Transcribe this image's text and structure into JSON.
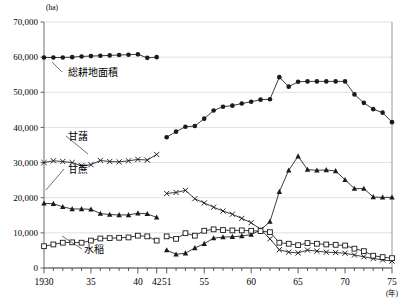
{
  "chart_data": {
    "type": "line",
    "title": "",
    "ylabel": "(ha)",
    "xlabel": "(年)",
    "ylim": [
      0,
      70000
    ],
    "ytick_labels": [
      "0",
      "10,000",
      "20,000",
      "30,000",
      "40,000",
      "50,000",
      "60,000",
      "70,000"
    ],
    "ytick_values": [
      0,
      10000,
      20000,
      30000,
      40000,
      50000,
      60000,
      70000
    ],
    "grid": true,
    "xtick_labels": [
      "1930",
      "35",
      "40",
      "42",
      "51",
      "55",
      "60",
      "65",
      "70",
      "75"
    ],
    "xtick_values": [
      1930,
      1935,
      1940,
      1942,
      1951,
      1955,
      1960,
      1965,
      1970,
      1975
    ],
    "axis_break": {
      "after": 1942,
      "before": 1951
    },
    "legend_position": "inline-annotations",
    "series": [
      {
        "name": "総耕地面積",
        "marker": "filled-circle",
        "x": [
          1930,
          1931,
          1932,
          1933,
          1934,
          1935,
          1936,
          1937,
          1938,
          1939,
          1940,
          1941,
          1942
        ],
        "values": [
          59900,
          59900,
          59900,
          60000,
          60200,
          60300,
          60400,
          60500,
          60600,
          60700,
          60800,
          59800,
          60000
        ]
      },
      {
        "name": "総耕地面積",
        "marker": "filled-circle",
        "x": [
          1951,
          1952,
          1953,
          1954,
          1955,
          1956,
          1957,
          1958,
          1959,
          1960,
          1961,
          1962,
          1963,
          1964,
          1965,
          1966,
          1967,
          1968,
          1969,
          1970,
          1971,
          1972,
          1973,
          1974,
          1975
        ],
        "values": [
          37200,
          38800,
          40200,
          40400,
          42500,
          44800,
          45900,
          46200,
          46800,
          47300,
          47900,
          48000,
          54300,
          51600,
          53000,
          53100,
          53100,
          53100,
          53100,
          53100,
          49400,
          47000,
          45200,
          44200,
          41500
        ]
      },
      {
        "name": "甘藷",
        "marker": "cross",
        "x": [
          1930,
          1931,
          1932,
          1933,
          1934,
          1935,
          1936,
          1937,
          1938,
          1939,
          1940,
          1941,
          1942
        ],
        "values": [
          30000,
          30500,
          30300,
          30000,
          29100,
          29400,
          30600,
          30300,
          30200,
          30500,
          30900,
          30700,
          32300
        ]
      },
      {
        "name": "甘藷",
        "marker": "cross",
        "x": [
          1951,
          1952,
          1953,
          1954,
          1955,
          1956,
          1957,
          1958,
          1959,
          1960,
          1961,
          1962,
          1963,
          1964,
          1965,
          1966,
          1967,
          1968,
          1969,
          1970,
          1971,
          1972,
          1973,
          1974,
          1975
        ],
        "values": [
          21200,
          21500,
          22100,
          19700,
          18500,
          17300,
          16200,
          15300,
          14100,
          12900,
          11000,
          8300,
          5200,
          4500,
          4300,
          5100,
          4800,
          4500,
          4400,
          4200,
          3700,
          3200,
          2700,
          2300,
          2000
        ]
      },
      {
        "name": "甘蔗",
        "marker": "filled-triangle",
        "x": [
          1930,
          1931,
          1932,
          1933,
          1934,
          1935,
          1936,
          1937,
          1938,
          1939,
          1940,
          1941,
          1942
        ],
        "values": [
          18400,
          18300,
          17400,
          16800,
          16800,
          16700,
          15500,
          15200,
          15100,
          15100,
          15600,
          15400,
          14400
        ]
      },
      {
        "name": "甘蔗",
        "marker": "filled-triangle",
        "x": [
          1951,
          1952,
          1953,
          1954,
          1955,
          1956,
          1957,
          1958,
          1959,
          1960,
          1961,
          1962,
          1963,
          1964,
          1965,
          1966,
          1967,
          1968,
          1969,
          1970,
          1971,
          1972,
          1973,
          1974,
          1975
        ],
        "values": [
          5100,
          3900,
          4200,
          5700,
          6900,
          8500,
          8800,
          8900,
          9100,
          9500,
          10800,
          13200,
          21700,
          27800,
          31800,
          28000,
          27800,
          27900,
          27600,
          25100,
          22600,
          22600,
          20200,
          20100,
          20100
        ]
      },
      {
        "name": "水稲",
        "marker": "open-square",
        "x": [
          1930,
          1931,
          1932,
          1933,
          1934,
          1935,
          1936,
          1937,
          1938,
          1939,
          1940,
          1941,
          1942
        ],
        "values": [
          6200,
          6700,
          7200,
          7300,
          7200,
          7800,
          8400,
          8500,
          8600,
          8700,
          9200,
          9000,
          7800
        ]
      },
      {
        "name": "水稲",
        "marker": "open-square",
        "x": [
          1951,
          1952,
          1953,
          1954,
          1955,
          1956,
          1957,
          1958,
          1959,
          1960,
          1961,
          1962,
          1963,
          1964,
          1965,
          1966,
          1967,
          1968,
          1969,
          1970,
          1971,
          1972,
          1973,
          1974,
          1975
        ],
        "values": [
          9000,
          8300,
          9900,
          9200,
          10600,
          11000,
          10800,
          10700,
          10700,
          10600,
          10500,
          10200,
          7200,
          6900,
          6500,
          7100,
          6900,
          6700,
          6600,
          6400,
          5500,
          4800,
          3500,
          3100,
          2800
        ]
      }
    ],
    "annotations": [
      {
        "label": "総耕地面積",
        "x": 68,
        "y": 76
      },
      {
        "label": "甘藷",
        "x": 68,
        "y": 140
      },
      {
        "label": "甘蔗",
        "x": 68,
        "y": 173
      },
      {
        "label": "水稲",
        "x": 84,
        "y": 253
      }
    ],
    "colors": {
      "line": "#1a1a1a",
      "grid": "#d8d8d8",
      "axis": "#555555",
      "background": "#ffffff"
    }
  }
}
